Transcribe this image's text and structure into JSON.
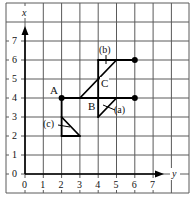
{
  "diagram": {
    "axes": {
      "vertical_label": "x",
      "horizontal_label": "y",
      "vertical_ticks": [
        "0",
        "1",
        "2",
        "3",
        "4",
        "5",
        "6",
        "7"
      ],
      "horizontal_ticks": [
        "0",
        "1",
        "2",
        "3",
        "4",
        "5",
        "6",
        "7"
      ]
    },
    "points": [
      {
        "label": "A",
        "x": 2,
        "y": 4,
        "dot": true
      },
      {
        "label": "B",
        "x": 4,
        "y": 4,
        "dot": false
      },
      {
        "label": "C",
        "x": 4,
        "y": 5,
        "dot": false
      },
      {
        "label": "",
        "x": 6,
        "y": 4,
        "dot": true
      },
      {
        "label": "",
        "x": 6,
        "y": 6,
        "dot": true
      }
    ],
    "shape_labels": {
      "a": "(a)",
      "b": "(b)",
      "c": "(c)"
    },
    "colors": {
      "grid": "#5a5a5a",
      "lines": "#000000",
      "background": "#ffffff"
    }
  }
}
